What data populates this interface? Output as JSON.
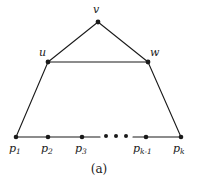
{
  "figure": {
    "caption": "(a)",
    "style": {
      "edge_color": "#1a1a1a",
      "vertex_color": "#1a1a1a",
      "background": "#ffffff",
      "edge_width": 1.1,
      "vertex_radius": 2.3
    },
    "vertices": [
      {
        "id": "v",
        "label": "v",
        "sub": "",
        "x": 98,
        "y": 22,
        "label_x": 95,
        "label_y": 5,
        "label_anchor": "above"
      },
      {
        "id": "u",
        "label": "u",
        "sub": "",
        "x": 48,
        "y": 62,
        "label_x": 40,
        "label_y": 48,
        "label_anchor": "above-left"
      },
      {
        "id": "w",
        "label": "w",
        "sub": "",
        "x": 148,
        "y": 62,
        "label_x": 150,
        "label_y": 48,
        "label_anchor": "above-right"
      },
      {
        "id": "p1",
        "label": "p",
        "sub": "1",
        "x": 16,
        "y": 137,
        "label_x": 9,
        "label_y": 143,
        "label_anchor": "below"
      },
      {
        "id": "p2",
        "label": "p",
        "sub": "2",
        "x": 48,
        "y": 137,
        "label_x": 41,
        "label_y": 143,
        "label_anchor": "below"
      },
      {
        "id": "p3",
        "label": "p",
        "sub": "3",
        "x": 82,
        "y": 137,
        "label_x": 75,
        "label_y": 143,
        "label_anchor": "below"
      },
      {
        "id": "pk1",
        "label": "p",
        "sub": "k-1",
        "x": 146,
        "y": 137,
        "label_x": 133,
        "label_y": 143,
        "label_anchor": "below"
      },
      {
        "id": "pk",
        "label": "p",
        "sub": "k",
        "x": 181,
        "y": 137,
        "label_x": 173,
        "label_y": 143,
        "label_anchor": "below"
      }
    ],
    "edges": [
      {
        "id": "v-u",
        "from": "v",
        "to": "u"
      },
      {
        "id": "v-w",
        "from": "v",
        "to": "w"
      },
      {
        "id": "u-w",
        "from": "u",
        "to": "w"
      },
      {
        "id": "u-p1",
        "from": "u",
        "to": "p1"
      },
      {
        "id": "w-pk",
        "from": "w",
        "to": "pk"
      },
      {
        "id": "p1-p2",
        "from": "p1",
        "to": "p2"
      },
      {
        "id": "p2-p3",
        "from": "p2",
        "to": "p3"
      },
      {
        "id": "p3-gap",
        "from": "p3",
        "to": "gapL"
      },
      {
        "id": "gap-pk1",
        "from": "gapR",
        "to": "pk1"
      },
      {
        "id": "pk1-pk",
        "from": "pk1",
        "to": "pk"
      }
    ],
    "gap_anchors": {
      "gapL": {
        "x": 100,
        "y": 137
      },
      "gapR": {
        "x": 133,
        "y": 137
      }
    },
    "ellipsis": {
      "label": "ellipsis",
      "y": 136,
      "dot_radius": 2.0,
      "dots_x": [
        106,
        116,
        126
      ]
    }
  }
}
